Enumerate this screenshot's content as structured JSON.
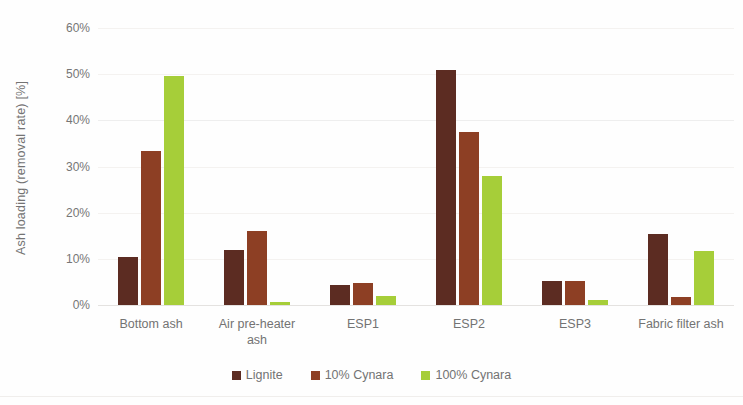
{
  "chart_data": {
    "type": "bar",
    "title": "",
    "xlabel": "",
    "ylabel": "Ash loading (removal rate) [%]",
    "ylim": [
      0,
      60
    ],
    "ytick_labels": [
      "60%",
      "50%",
      "40%",
      "30%",
      "20%",
      "10%",
      "0%"
    ],
    "ytick_values": [
      60,
      50,
      40,
      30,
      20,
      10,
      0
    ],
    "grid": true,
    "legend_position": "bottom",
    "categories": [
      "Bottom ash",
      "Air pre-heater ash",
      "ESP1",
      "ESP2",
      "ESP3",
      "Fabric filter ash"
    ],
    "category_lines": [
      [
        "Bottom ash"
      ],
      [
        "Air pre-heater",
        "ash"
      ],
      [
        "ESP1"
      ],
      [
        "ESP2"
      ],
      [
        "ESP3"
      ],
      [
        "Fabric filter ash"
      ]
    ],
    "series": [
      {
        "name": "Lignite",
        "color": "#5c2c22",
        "values": [
          10.3,
          12.0,
          4.4,
          50.8,
          5.3,
          15.3
        ]
      },
      {
        "name": "10% Cynara",
        "color": "#8d3f24",
        "values": [
          33.3,
          16.0,
          4.8,
          37.5,
          5.3,
          1.7
        ]
      },
      {
        "name": "100% Cynara",
        "color": "#a6ce39",
        "values": [
          49.5,
          0.7,
          2.0,
          28.0,
          1.1,
          11.8
        ]
      }
    ]
  },
  "axis": {
    "y_title": "Ash loading (removal rate) [%]"
  },
  "legend": {
    "items": [
      {
        "label": "Lignite",
        "color": "#5c2c22"
      },
      {
        "label": "10% Cynara",
        "color": "#8d3f24"
      },
      {
        "label": "100% Cynara",
        "color": "#a6ce39"
      }
    ]
  }
}
